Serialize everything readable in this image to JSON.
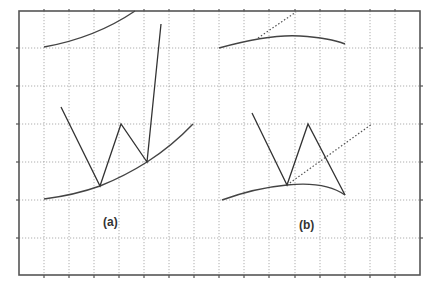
{
  "diagram": {
    "frame": {
      "left": 19,
      "top": 11,
      "right": 420,
      "bottom": 275
    },
    "grid": {
      "vertical_x": [
        44,
        69,
        94,
        119,
        144,
        169,
        194,
        219,
        244,
        269,
        295,
        320,
        345,
        370,
        395
      ],
      "horizontal_y": [
        48,
        86,
        124,
        162,
        200,
        238
      ]
    },
    "colors": {
      "line": "#333333",
      "grid": "#9a9a9a",
      "frame": "#555555"
    },
    "panels": [
      {
        "id": "a",
        "label": "(a)",
        "label_pos": {
          "x": 103,
          "y": 215
        },
        "top_curve": "M44,47 Q95,38 135,11",
        "bottom_curve": "M44,199 Q75,195 100,186 Q125,176 147,162 Q172,146 193,124",
        "polyline": "61,107 100,186 121,124 147,162 161,24"
      },
      {
        "id": "b",
        "label": "(b)",
        "label_pos": {
          "x": 299,
          "y": 218
        },
        "top_curve": "M219,48 Q270,34 300,36 Q330,38 345,44",
        "top_dotted": "M258,38 L296,12",
        "bottom_curve": "M222,200 Q255,188 287,185 Q325,181 345,195",
        "bottom_dotted": "M287,185 L372,124",
        "polyline": "252,113 287,185 308,124 345,195"
      }
    ]
  }
}
